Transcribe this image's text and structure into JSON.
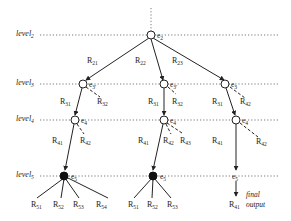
{
  "diagram": {
    "levels": [
      {
        "name": "level",
        "sub": "2",
        "y": 35
      },
      {
        "name": "level",
        "sub": "3",
        "y": 84
      },
      {
        "name": "level",
        "sub": "4",
        "y": 120
      },
      {
        "name": "level",
        "sub": "5",
        "y": 176
      }
    ],
    "root": {
      "label": "e",
      "sub": "2"
    },
    "edges_level2": [
      {
        "label": "R",
        "sub": "21"
      },
      {
        "label": "R",
        "sub": "22"
      },
      {
        "label": "R",
        "sub": "23"
      }
    ],
    "branches": [
      {
        "level3_node": {
          "label": "e",
          "sub": "3'"
        },
        "level3_edges": [
          {
            "label": "R",
            "sub": "31",
            "style": "solid"
          },
          {
            "label": "R",
            "sub": "32",
            "style": "dashed"
          }
        ],
        "level4_node": {
          "label": "e",
          "sub": "4"
        },
        "level4_edges": [
          {
            "label": "R",
            "sub": "41",
            "style": "solid"
          },
          {
            "label": "R",
            "sub": "42",
            "style": "dashed"
          }
        ],
        "level5_node": {
          "label": "e",
          "sub": "5",
          "filled": true
        },
        "level5_edges": [
          {
            "label": "R",
            "sub": "51"
          },
          {
            "label": "R",
            "sub": "52"
          },
          {
            "label": "R",
            "sub": "53"
          },
          {
            "label": "R",
            "sub": "54"
          }
        ]
      },
      {
        "level3_node": {
          "label": "e",
          "sub": "3'"
        },
        "level3_edges": [
          {
            "label": "R",
            "sub": "31",
            "style": "solid"
          },
          {
            "label": "R",
            "sub": "32",
            "style": "dashed"
          }
        ],
        "level4_node": {
          "label": "e",
          "sub": "4"
        },
        "level4_edges": [
          {
            "label": "R",
            "sub": "41",
            "style": "solid"
          },
          {
            "label": "R",
            "sub": "42",
            "style": "dashed"
          },
          {
            "label": "R",
            "sub": "43",
            "style": "dashed"
          }
        ],
        "level5_node": {
          "label": "e",
          "sub": "5",
          "filled": true
        },
        "level5_edges": [
          {
            "label": "R",
            "sub": "51"
          },
          {
            "label": "R",
            "sub": "52"
          },
          {
            "label": "R",
            "sub": "53"
          }
        ]
      },
      {
        "level3_node": {
          "label": "e",
          "sub": "3"
        },
        "level3_edges": [
          {
            "label": "R",
            "sub": "31",
            "style": "solid"
          },
          {
            "label": "R",
            "sub": "42",
            "style": "dashed"
          }
        ],
        "level4_node": {
          "label": "e",
          "sub": "4"
        },
        "level4_edges": [
          {
            "label": "R",
            "sub": "42",
            "style": "dashed"
          }
        ],
        "level5_node": {
          "label": "e",
          "sub": "5",
          "filled": false
        },
        "final_edge": {
          "label": "R",
          "sub": "41"
        },
        "final_note_line1": "final",
        "final_note_line2": "output"
      }
    ]
  }
}
